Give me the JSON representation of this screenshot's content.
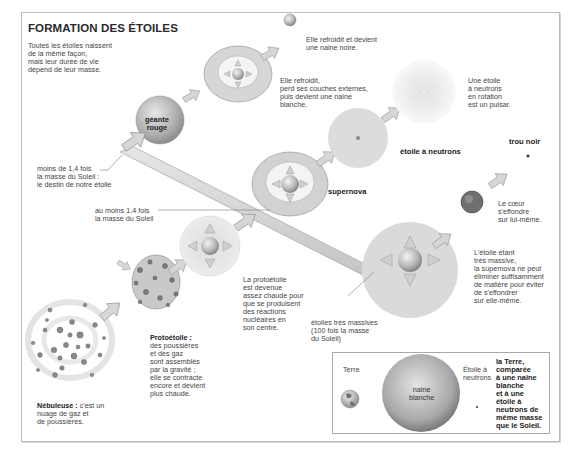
{
  "title": "FORMATION DES ÉTOILES",
  "intro": "Toutes les étoiles naissent\nde la même façon,\nmais leur durée de vie\ndépend de leur masse.",
  "stages": {
    "nebuleuse": {
      "label": "Nébuleuse :",
      "text": " c'est un\nnuage de gaz et\nde poussières."
    },
    "protoetoile": {
      "label": "Protoétoile :",
      "text": "des poussières\net des gaz\nsont assemblés\npar la gravité ;\nelle se contracte\nencore et devient\nplus chaude."
    },
    "protoetoile_chaude": "La protoétoile\nest devenue\nassez chaude pour\nque se produisent\ndes réactions\nnucléaires en\nson centre.",
    "geante_rouge": "géante\nrouge",
    "naine_blanche_text": "Elle refroidit,\nperd ses couches externes,\npuis devient une naine\nblanche.",
    "naine_noire_text": "Elle refroidit et devient\nune naine noire.",
    "supernova": "supernova",
    "etoile_neutrons": "étoile à neutrons",
    "pulsar_text": "Une étoile\nà neutrons\nen rotation\nest un pulsar.",
    "trou_noir": "trou noir",
    "coeur_text": "Le cœur\ns'effondre\nsur lui-même.",
    "tres_massive_text": "L'étoile étant\ntrès massive,\nla supernova ne peut\néliminer suffisamment\nde matière pour éviter\nde s'effondrer\nsur elle-même."
  },
  "mass_paths": {
    "low": "moins de 1,4 fois\nla masse du Soleil :\nle destin de notre étoile",
    "medium": "au moins 1,4 fois\nla masse du Soleil",
    "high": "étoiles très massives\n(100 fois la masse\ndu Soleil)"
  },
  "comparison": {
    "terre": "Terre",
    "naine_blanche": "naine\nblanche",
    "etoile_neutrons": "Étoile à\nneutrons",
    "caption": "la Terre,\ncomparée\nà une naine\nblanche\net à une\nétoile à\nneutrons de\nmême masse\nque le Soleil."
  },
  "colors": {
    "arrow_fill": "#d4d4d4",
    "arrow_stroke": "#9a9a9a",
    "sphere_light": "#ececec",
    "sphere_dark": "#8c8c8c",
    "halo": "#e3e3e3",
    "frame": "#bdbdbd"
  }
}
